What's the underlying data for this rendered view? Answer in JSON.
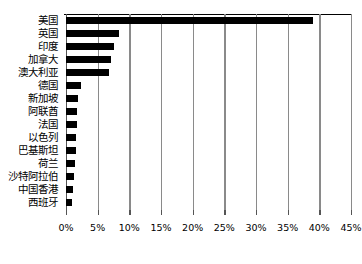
{
  "chart_data": {
    "type": "bar",
    "orientation": "horizontal",
    "title": "",
    "xlabel": "",
    "ylabel": "",
    "xlim": [
      0,
      45
    ],
    "xticks": [
      0,
      5,
      10,
      15,
      20,
      25,
      30,
      35,
      40,
      45
    ],
    "xtick_labels": [
      "0%",
      "5%",
      "10%",
      "15%",
      "20%",
      "25%",
      "30%",
      "35%",
      "40%",
      "45%"
    ],
    "grid": "vertical",
    "legend": "none",
    "bar_color": "#000000",
    "gridline_color": "#8a8a8a",
    "categories": [
      "美国",
      "英国",
      "印度",
      "加拿大",
      "澳大利亚",
      "德国",
      "新加坡",
      "阿联酋",
      "法国",
      "以色列",
      "巴基斯坦",
      "荷兰",
      "沙特阿拉伯",
      "中国香港",
      "西班牙"
    ],
    "values": [
      39.0,
      8.4,
      7.5,
      7.1,
      6.8,
      2.3,
      1.9,
      1.8,
      1.7,
      1.6,
      1.6,
      1.4,
      1.3,
      1.1,
      1.0
    ]
  }
}
